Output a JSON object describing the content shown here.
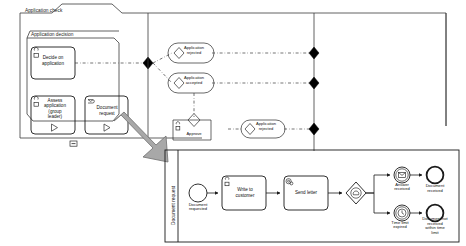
{
  "diagram": {
    "title": "Application check",
    "type": "bpmn-process-diagram"
  },
  "outer_pool": {
    "label": "Application check",
    "tab_label": "Application check"
  },
  "inner_pool": {
    "label": "Application decision",
    "collapse_marker": "minus-marker"
  },
  "subprocess_pool": {
    "lane_label": "Document request"
  },
  "tasks": [
    {
      "id": "decide-on-application",
      "label": "Decide on application",
      "icon": "user-task-icon",
      "marker": "none"
    },
    {
      "id": "assess-application",
      "label": "Assess application (group leader)",
      "icon": "user-task-icon",
      "marker": "expand-triangle"
    },
    {
      "id": "document-request",
      "label": "Document request",
      "icon": "message-task-icon",
      "marker": "expand-triangle"
    },
    {
      "id": "approve",
      "label": "Approve",
      "icon": "user-task-icon",
      "marker": "none"
    },
    {
      "id": "write-to-customer",
      "label": "Write to customer",
      "icon": "user-task-icon",
      "marker": "none"
    },
    {
      "id": "send-letter",
      "label": "Send letter",
      "icon": "service-task-icon",
      "marker": "none"
    }
  ],
  "events": [
    {
      "id": "application-rejected-1",
      "label": "Application rejected",
      "kind": "end-event-capsule"
    },
    {
      "id": "application-accepted",
      "label": "Application accepted",
      "kind": "end-event-capsule"
    },
    {
      "id": "application-rejected-2",
      "label": "Application rejected",
      "kind": "end-event-capsule"
    },
    {
      "id": "document-requested",
      "label": "Document requested",
      "kind": "start-event"
    },
    {
      "id": "answer-received",
      "label": "Answer received",
      "kind": "intermediate-message-event"
    },
    {
      "id": "time-limit-expired",
      "label": "Time limit expired",
      "kind": "intermediate-timer-event"
    },
    {
      "id": "document-received",
      "label": "Document received",
      "kind": "end-event"
    },
    {
      "id": "document-not-received",
      "label": "Document not received within time limit",
      "kind": "end-event"
    }
  ],
  "gateways": [
    {
      "id": "gateway-reject-1",
      "kind": "exclusive-gateway"
    },
    {
      "id": "gateway-accept",
      "kind": "exclusive-gateway"
    },
    {
      "id": "gateway-approve",
      "kind": "exclusive-gateway"
    },
    {
      "id": "gateway-reject-2",
      "kind": "exclusive-gateway"
    },
    {
      "id": "gateway-event-based",
      "kind": "event-based-gateway"
    }
  ],
  "connectors": [
    {
      "id": "connector-left-1",
      "kind": "filled-diamond-connector"
    },
    {
      "id": "connector-right-1",
      "kind": "filled-diamond-connector"
    },
    {
      "id": "connector-right-2",
      "kind": "filled-diamond-connector"
    },
    {
      "id": "connector-right-3",
      "kind": "filled-diamond-connector"
    }
  ],
  "annotation": {
    "drilldown_arrow": "drilldown-arrow-icon"
  },
  "colors": {
    "stroke": "#1a1a1a",
    "background": "#ffffff",
    "arrow_fill": "#a8a8a8",
    "arrow_stroke": "#6e6e6e"
  }
}
